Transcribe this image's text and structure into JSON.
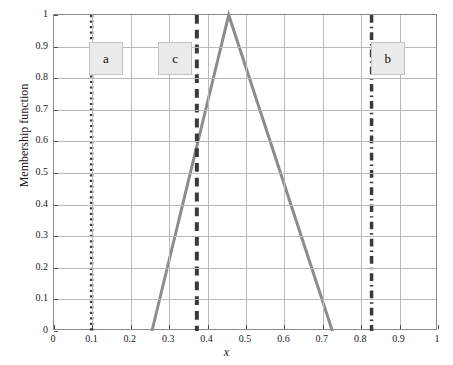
{
  "chart_data": {
    "type": "line",
    "title": "",
    "xlabel": "x",
    "ylabel": "Membership function",
    "xlim": [
      0,
      1
    ],
    "ylim": [
      0,
      1
    ],
    "grid": true,
    "legend": "none",
    "xticks": [
      "0",
      "0.1",
      "0.2",
      "0.3",
      "0.4",
      "0.5",
      "0.6",
      "0.7",
      "0.8",
      "0.9",
      "1"
    ],
    "xtick_values": [
      0,
      0.1,
      0.2,
      0.3,
      0.4,
      0.5,
      0.6,
      0.7,
      0.8,
      0.9,
      1
    ],
    "yticks": [
      "0",
      "0.1",
      "0.2",
      "0.3",
      "0.4",
      "0.5",
      "0.6",
      "0.7",
      "0.8",
      "0.9",
      "1"
    ],
    "ytick_values": [
      0,
      0.1,
      0.2,
      0.3,
      0.4,
      0.5,
      0.6,
      0.7,
      0.8,
      0.9,
      1
    ],
    "series": [
      {
        "name": "membership-function",
        "style": "solid",
        "color": "#8c8c8c",
        "width": 3,
        "x": [
          0.255,
          0.455,
          0.725
        ],
        "values": [
          0,
          1,
          0
        ]
      }
    ],
    "vertical_lines": [
      {
        "name": "a",
        "x": 0.098,
        "style": "dotted",
        "color": "#3a3a3a",
        "width": 3.5,
        "label": "a"
      },
      {
        "name": "c",
        "x": 0.372,
        "style": "dashed",
        "color": "#3a3a3a",
        "width": 4.0,
        "label": "c"
      },
      {
        "name": "b",
        "x": 0.827,
        "style": "dashdot",
        "color": "#3a3a3a",
        "width": 3.5,
        "label": "b"
      }
    ],
    "annotations": [
      {
        "text": "a",
        "x": 0.138,
        "y": 0.862
      },
      {
        "text": "c",
        "x": 0.318,
        "y": 0.862
      },
      {
        "text": "b",
        "x": 0.872,
        "y": 0.862
      }
    ]
  },
  "colors": {
    "series": "#8c8c8c",
    "marker_line": "#3a3a3a",
    "grid": "#b9b9b9",
    "axis": "#8a8a8a",
    "label_box_fill": "#ebebeb",
    "label_box_border": "#c2c2c2",
    "background": "#ffffff"
  }
}
